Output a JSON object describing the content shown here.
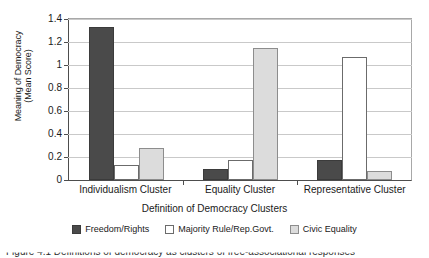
{
  "chart_data": {
    "type": "bar",
    "title": "",
    "xlabel": "Definition of Democracy Clusters",
    "ylabel": "Meaning of Democracy (Mean Score)",
    "ylabel_line1": "Meaning of Democracy",
    "ylabel_line2": "(Mean Score)",
    "categories": [
      "Individualism Cluster",
      "Equality Cluster",
      "Representative Cluster"
    ],
    "series": [
      {
        "name": "Freedom/Rights",
        "color": "#4a4a4a",
        "values": [
          1.33,
          0.1,
          0.17
        ]
      },
      {
        "name": "Majority Rule/Rep.Govt.",
        "color": "#ffffff",
        "values": [
          0.13,
          0.17,
          1.07
        ]
      },
      {
        "name": "Civic Equality",
        "color": "#dcdcdc",
        "values": [
          0.28,
          1.15,
          0.08
        ]
      }
    ],
    "ylim": [
      0,
      1.4
    ],
    "yticks": [
      "0",
      "0.2",
      "0.4",
      "0.6",
      "0.8",
      "1",
      "1.2",
      "1.4"
    ],
    "ytick_values": [
      0,
      0.2,
      0.4,
      0.6,
      0.8,
      1.0,
      1.2,
      1.4
    ],
    "grid": true,
    "legend_position": "bottom"
  },
  "caption": {
    "text": "Figure 4.1  Definitions of democracy as clusters of free-associational responses"
  }
}
